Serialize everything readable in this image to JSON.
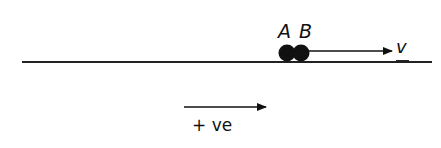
{
  "diagram": {
    "type": "physics-collision",
    "particles": [
      {
        "label": "A",
        "color": "#111111"
      },
      {
        "label": "B",
        "color": "#111111"
      }
    ],
    "velocity_label": "v",
    "sign_convention": {
      "label": "+ ve",
      "direction": "right"
    },
    "colors": {
      "ink": "#111111",
      "background": "#ffffff"
    }
  }
}
